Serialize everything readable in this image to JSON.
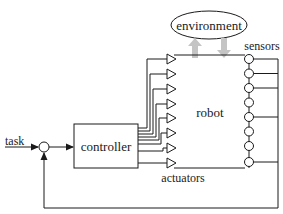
{
  "diagram": {
    "labels": {
      "environment": "environment",
      "sensors": "sensors",
      "robot": "robot",
      "controller": "controller",
      "actuators": "actuators",
      "task": "task"
    },
    "actuator_count": 8,
    "sensor_count": 8,
    "sensors_connected_to_feedback": [
      1,
      2,
      3,
      5,
      8
    ],
    "colors": {
      "line": "#1a1a1a",
      "interaction_arrows": "#c4c4c4",
      "background": "#ffffff"
    },
    "nodes": [
      {
        "id": "task",
        "type": "input"
      },
      {
        "id": "summing-junction",
        "type": "comparator"
      },
      {
        "id": "controller",
        "type": "block"
      },
      {
        "id": "actuators",
        "type": "group"
      },
      {
        "id": "robot",
        "type": "block"
      },
      {
        "id": "sensors",
        "type": "group"
      },
      {
        "id": "environment",
        "type": "ellipse"
      }
    ],
    "edges": [
      {
        "from": "task",
        "to": "summing-junction"
      },
      {
        "from": "summing-junction",
        "to": "controller"
      },
      {
        "from": "controller",
        "to": "actuators"
      },
      {
        "from": "actuators",
        "to": "robot"
      },
      {
        "from": "robot",
        "to": "environment",
        "style": "gray-arrow-up"
      },
      {
        "from": "environment",
        "to": "robot",
        "style": "gray-arrow-down"
      },
      {
        "from": "sensors",
        "to": "summing-junction",
        "label": "feedback"
      }
    ]
  }
}
